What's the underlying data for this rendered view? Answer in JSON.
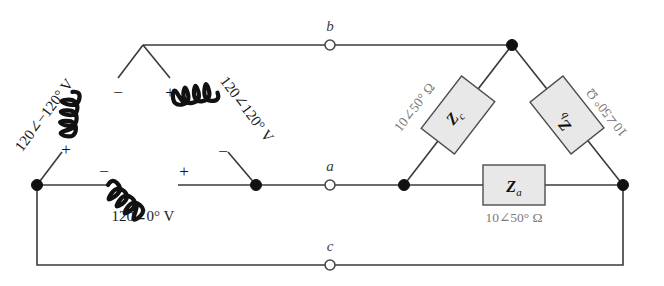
{
  "diagram": {
    "terminals": [
      {
        "id": "b",
        "label": "b",
        "x": 330,
        "y": 45
      },
      {
        "id": "a",
        "label": "a",
        "x": 330,
        "y": 185
      },
      {
        "id": "c",
        "label": "c",
        "x": 330,
        "y": 265
      }
    ],
    "source": {
      "type": "delta-connected-voltage-source",
      "phases": [
        {
          "id": "ab",
          "label": "120∠−120° V",
          "plus": "+",
          "minus": "−"
        },
        {
          "id": "bc",
          "label": "120∠120° V",
          "plus": "+",
          "minus": "−"
        },
        {
          "id": "ca",
          "label": "120∠0° V",
          "plus": "+",
          "minus": "−"
        }
      ]
    },
    "load": {
      "type": "delta-connected-impedance-load",
      "impedances": [
        {
          "id": "Za",
          "symbol": "Z",
          "subscript": "a",
          "value": "10∠50° Ω"
        },
        {
          "id": "Zb",
          "symbol": "Z",
          "subscript": "b",
          "value": "10∠50° Ω"
        },
        {
          "id": "Zc",
          "symbol": "Z",
          "subscript": "c",
          "value": "10∠50° Ω"
        }
      ]
    },
    "signs": {
      "left_coil_minus": "−",
      "left_coil_plus": "+",
      "right_coil_plus": "+",
      "right_coil_minus": "−",
      "bottom_coil_minus": "−",
      "bottom_coil_plus": "+"
    },
    "colors": {
      "wire": "#3a3a3a",
      "node": "#111111",
      "box_fill": "#e8e8e8",
      "box_stroke": "#4d4d4d",
      "impedance_label": "#7a7a7a",
      "terminal_label": "#3c3c3c"
    }
  }
}
